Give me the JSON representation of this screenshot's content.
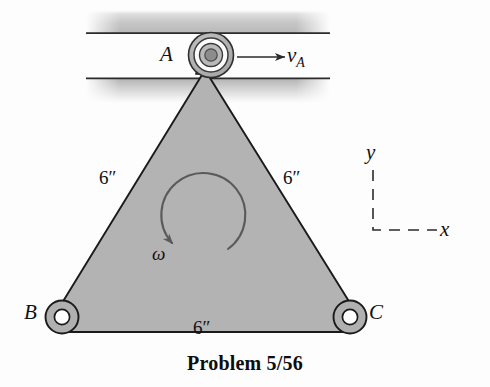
{
  "figure": {
    "caption": "Problem 5/56",
    "title": "Problem 5/56"
  },
  "labels": {
    "point_a": "A",
    "point_b": "B",
    "point_c": "C",
    "velocity_symbol": "v",
    "velocity_subscript": "A",
    "omega": "ω",
    "axis_y": "y",
    "axis_x": "x",
    "side_left_length": "6″",
    "side_right_length": "6″",
    "side_bottom_length": "6″"
  },
  "geometry": {
    "triangle_apex": [
      205,
      74
    ],
    "triangle_left_vertex": [
      62,
      317
    ],
    "triangle_right_vertex": [
      350,
      317
    ],
    "joint_a_center": [
      211,
      55
    ],
    "joint_b_center": [
      62,
      317
    ],
    "joint_c_center": [
      350,
      317
    ],
    "rail_top_band": [
      86,
      10,
      244,
      24
    ],
    "rail_bottom_band": [
      86,
      78,
      244,
      25
    ],
    "velocity_arrow": [
      237,
      57,
      287,
      57
    ],
    "omega_arc_center": [
      201,
      215
    ],
    "omega_arc_radius": 42,
    "axis_corner": [
      373,
      230
    ],
    "axis_vertical_top": 170,
    "axis_horizontal_right": 437
  },
  "colors": {
    "body_fill": "#b3b3b3",
    "body_stroke": "#1a1a1a",
    "joint_fill": "#b0b0b0",
    "joint_hole": "#ffffff",
    "hub_pin": "#8c8c8c",
    "rail_dark": "#9a9a9a",
    "rail_line": "#2b2b2b",
    "arrow": "#2b2b2b",
    "omega_arc": "#5a5a5a",
    "text": "#111111",
    "background": "#fdfdfd"
  }
}
